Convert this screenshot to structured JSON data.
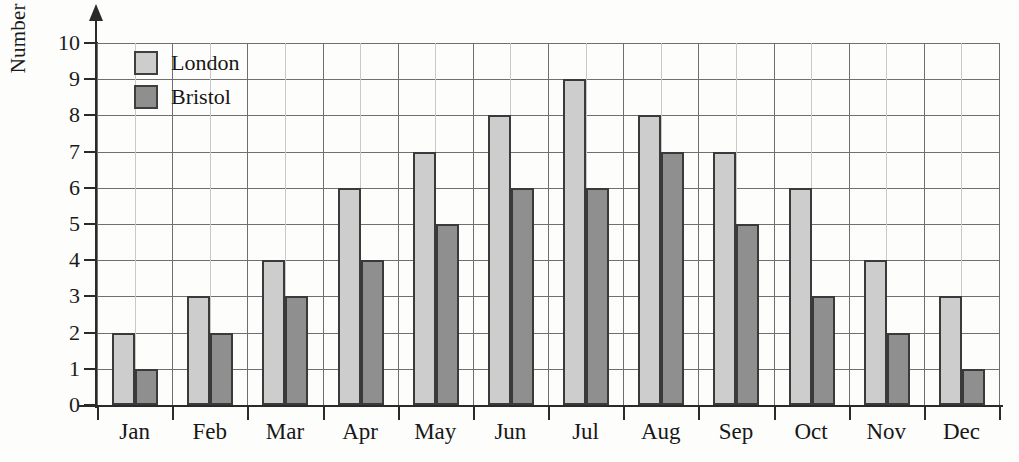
{
  "chart_data": {
    "type": "bar",
    "title": "",
    "subtitle": "",
    "xlabel": "",
    "ylabel": "Number of hours",
    "categories": [
      "Jan",
      "Feb",
      "Mar",
      "Apr",
      "May",
      "Jun",
      "Jul",
      "Aug",
      "Sep",
      "Oct",
      "Nov",
      "Dec"
    ],
    "series": [
      {
        "name": "London",
        "color": "#cdcdcd",
        "values": [
          2,
          3,
          4,
          6,
          7,
          8,
          9,
          8,
          7,
          6,
          4,
          3
        ]
      },
      {
        "name": "Bristol",
        "color": "#8f8f8f",
        "values": [
          1,
          2,
          3,
          4,
          5,
          6,
          6,
          7,
          5,
          3,
          2,
          1
        ]
      }
    ],
    "ylim": [
      0,
      10
    ],
    "ytick_labels": [
      "0",
      "1",
      "2",
      "3",
      "4",
      "5",
      "6",
      "7",
      "8",
      "9",
      "10"
    ],
    "ytick_values": [
      0,
      1,
      2,
      3,
      4,
      5,
      6,
      7,
      8,
      9,
      10
    ],
    "grid": true,
    "grid_color_major": "#6f6f6f",
    "grid_color_minor": "#c9c9c9",
    "legend_position": "top-left",
    "axis_color": "#2a2a2a",
    "bar_border_color": "#3a3a3a",
    "background_color": "#fdfdfc"
  },
  "legend": {
    "entries": [
      {
        "label": "London",
        "color": "#cdcdcd"
      },
      {
        "label": "Bristol",
        "color": "#8f8f8f"
      }
    ]
  }
}
